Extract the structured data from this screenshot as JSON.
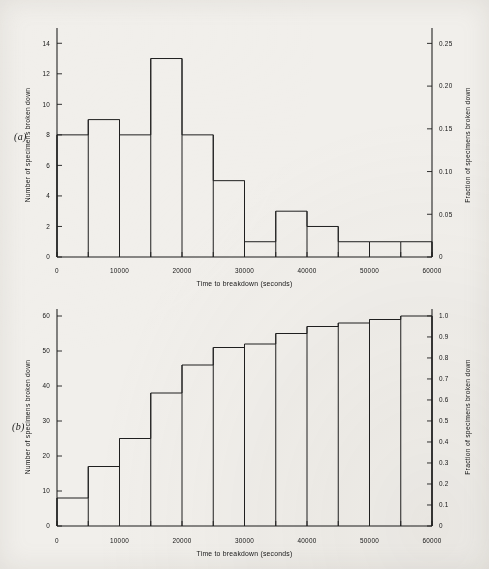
{
  "figure": {
    "background_color": "#f1efeb",
    "ink_color": "#1c1c1c",
    "panels": [
      {
        "tag": "(a)",
        "tag_x": 14,
        "tag_y": 131
      },
      {
        "tag": "(b)",
        "tag_x": 12,
        "tag_y": 421
      }
    ]
  },
  "chart_data": [
    {
      "type": "bar",
      "title": "",
      "panel_label": "(a)",
      "xlabel": "Time to breakdown (seconds)",
      "ylabel": "Number of specimens broken down",
      "ylabel_right": "Fraction of specimens broken down",
      "xlim": [
        0,
        60000
      ],
      "ylim": [
        0,
        15
      ],
      "ylim_right": [
        0,
        0.268
      ],
      "grid": false,
      "legend": "none",
      "bin_width": 5000,
      "bin_edges": [
        0,
        5000,
        10000,
        15000,
        20000,
        25000,
        30000,
        35000,
        40000,
        45000,
        50000,
        55000,
        60000
      ],
      "categories": [
        "0-5000",
        "5000-10000",
        "10000-15000",
        "15000-20000",
        "20000-25000",
        "25000-30000",
        "30000-35000",
        "35000-40000",
        "40000-45000",
        "45000-50000",
        "50000-55000",
        "55000-60000"
      ],
      "values": [
        8,
        9,
        8,
        13,
        8,
        5,
        1,
        3,
        2,
        1,
        1,
        1
      ],
      "fractions": [
        0.133,
        0.15,
        0.133,
        0.217,
        0.133,
        0.083,
        0.017,
        0.05,
        0.033,
        0.017,
        0.017,
        0.017
      ],
      "total": 60,
      "xticks": [
        0,
        5000,
        10000,
        15000,
        20000,
        25000,
        30000,
        35000,
        40000,
        45000,
        50000,
        55000,
        60000
      ],
      "xticklabels": [
        "0",
        "",
        "10000",
        "",
        "20000",
        "",
        "30000",
        "",
        "40000",
        "",
        "50000",
        "",
        "60000"
      ],
      "yticks": [
        0,
        2,
        4,
        6,
        8,
        10,
        12,
        14
      ],
      "yticklabels": [
        "0",
        "2",
        "4",
        "6",
        "8",
        "10",
        "12",
        "14"
      ],
      "yticks_right": [
        0,
        0.05,
        0.1,
        0.15,
        0.2,
        0.25
      ],
      "yticklabels_right": [
        "0",
        "0.05",
        "0.10",
        "0.15",
        "0.20",
        "0.25"
      ]
    },
    {
      "type": "bar",
      "title": "",
      "panel_label": "(b)",
      "xlabel": "Time to breakdown (seconds)",
      "ylabel": "Number of specimens broken down",
      "ylabel_right": "Fraction of specimens broken down",
      "xlim": [
        0,
        60000
      ],
      "ylim": [
        0,
        62
      ],
      "ylim_right": [
        0,
        1.033
      ],
      "grid": false,
      "legend": "none",
      "cumulative": true,
      "bin_width": 5000,
      "bin_edges": [
        0,
        5000,
        10000,
        15000,
        20000,
        25000,
        30000,
        35000,
        40000,
        45000,
        50000,
        55000,
        60000
      ],
      "categories": [
        "0-5000",
        "5000-10000",
        "10000-15000",
        "15000-20000",
        "20000-25000",
        "25000-30000",
        "30000-35000",
        "35000-40000",
        "40000-45000",
        "45000-50000",
        "50000-55000",
        "55000-60000"
      ],
      "values": [
        8,
        17,
        25,
        38,
        46,
        51,
        52,
        55,
        57,
        58,
        59,
        60
      ],
      "fractions": [
        0.133,
        0.283,
        0.417,
        0.633,
        0.767,
        0.85,
        0.867,
        0.917,
        0.95,
        0.967,
        0.983,
        1.0
      ],
      "total": 60,
      "xticks": [
        0,
        5000,
        10000,
        15000,
        20000,
        25000,
        30000,
        35000,
        40000,
        45000,
        50000,
        55000,
        60000
      ],
      "xticklabels": [
        "0",
        "",
        "10000",
        "",
        "20000",
        "",
        "30000",
        "",
        "40000",
        "",
        "50000",
        "",
        "60000"
      ],
      "yticks": [
        0,
        10,
        20,
        30,
        40,
        50,
        60
      ],
      "yticklabels": [
        "0",
        "10",
        "20",
        "30",
        "40",
        "50",
        "60"
      ],
      "yticks_right": [
        0,
        0.1,
        0.2,
        0.3,
        0.4,
        0.5,
        0.6,
        0.7,
        0.8,
        0.9,
        1.0
      ],
      "yticklabels_right": [
        "0",
        "0.1",
        "0.2",
        "0.3",
        "0.4",
        "0.5",
        "0.6",
        "0.7",
        "0.8",
        "0.9",
        "1.0"
      ]
    }
  ]
}
